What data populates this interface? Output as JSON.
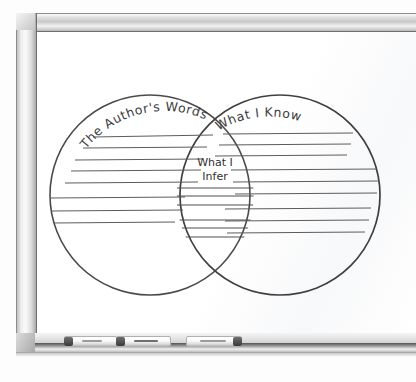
{
  "scene": {
    "name": "classroom-whiteboard",
    "surface_color": "#ffffff",
    "frame_color": "#c9c9c9",
    "ink_color": "#4a4a4a"
  },
  "diagram": {
    "type": "venn",
    "title": "",
    "circles": [
      {
        "id": "left",
        "label": "The Author's Words",
        "label_placement": "arc-top-left",
        "cx": 115,
        "cy": 165,
        "r": 100,
        "ruled_lines": 8
      },
      {
        "id": "right",
        "label": "What I Know",
        "label_placement": "arc-top-right",
        "cx": 245,
        "cy": 165,
        "r": 100,
        "ruled_lines": 8
      }
    ],
    "intersection": {
      "id": "center",
      "label_line1": "What I",
      "label_line2": "Infer",
      "ruled_lines": 6
    }
  },
  "tray": {
    "name": "marker-tray",
    "markers": [
      {
        "id": "marker-1",
        "cap_side": "left",
        "color": "#ffffff",
        "cap_color": "#3a3a3a"
      },
      {
        "id": "marker-2",
        "cap_side": "left",
        "color": "#ffffff",
        "cap_color": "#3a3a3a"
      },
      {
        "id": "marker-3",
        "cap_side": "right",
        "color": "#ffffff",
        "cap_color": "#3a3a3a"
      }
    ]
  }
}
